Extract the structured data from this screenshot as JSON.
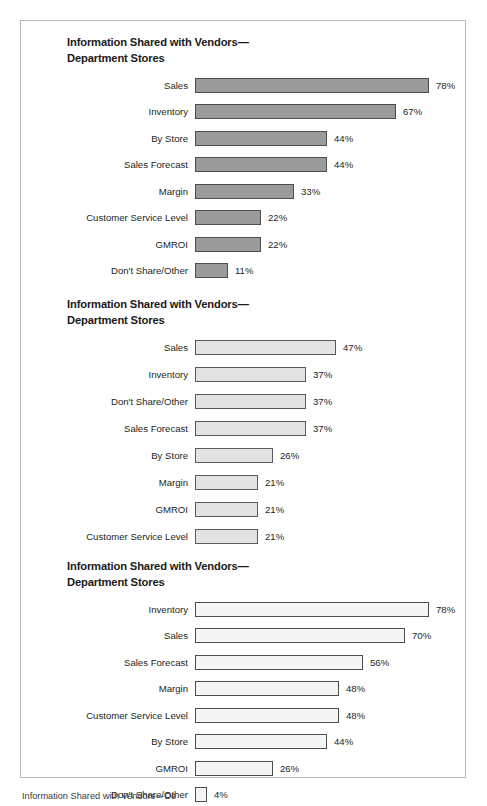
{
  "chart_data": [
    {
      "type": "bar",
      "orientation": "horizontal",
      "title": "Information Shared with Vendors—\nDepartment Stores",
      "title_line_1": "Information Shared with Vendors—",
      "title_line_2": "Department Stores",
      "xlabel": "",
      "ylabel": "",
      "xlim": [
        0,
        78
      ],
      "grid": false,
      "legend": "none",
      "value_suffix": "%",
      "categories": [
        "Sales",
        "Inventory",
        "By Store",
        "Sales Forecast",
        "Margin",
        "Customer Service Level",
        "GMROI",
        "Don't Share/Other"
      ],
      "values": [
        78,
        67,
        44,
        44,
        33,
        22,
        22,
        11
      ],
      "value_labels": [
        "78%",
        "67%",
        "44%",
        "44%",
        "33%",
        "22%",
        "22%",
        "11%"
      ],
      "bar_fill": "#9b9b9b",
      "bar_stroke": "#4d4d4d"
    },
    {
      "type": "bar",
      "orientation": "horizontal",
      "title": "Information Shared with Vendors—\nDepartment Stores",
      "title_line_1": "Information Shared with Vendors—",
      "title_line_2": "Department Stores",
      "xlabel": "",
      "ylabel": "",
      "xlim": [
        0,
        78
      ],
      "grid": false,
      "legend": "none",
      "value_suffix": "%",
      "categories": [
        "Sales",
        "Inventory",
        "Don't Share/Other",
        "Sales Forecast",
        "By Store",
        "Margin",
        "GMROI",
        "Customer Service Level"
      ],
      "values": [
        47,
        37,
        37,
        37,
        26,
        21,
        21,
        21
      ],
      "value_labels": [
        "47%",
        "37%",
        "37%",
        "37%",
        "26%",
        "21%",
        "21%",
        "21%"
      ],
      "bar_fill": "#e3e3e3",
      "bar_stroke": "#595959"
    },
    {
      "type": "bar",
      "orientation": "horizontal",
      "title": "Information Shared with Vendors—\nDepartment Stores",
      "title_line_1": "Information Shared with Vendors—",
      "title_line_2": "Department Stores",
      "xlabel": "",
      "ylabel": "",
      "xlim": [
        0,
        78
      ],
      "grid": false,
      "legend": "none",
      "value_suffix": "%",
      "categories": [
        "Inventory",
        "Sales",
        "Sales Forecast",
        "Margin",
        "Customer Service Level",
        "By Store",
        "GMROI",
        "Don't Share/Other"
      ],
      "values": [
        78,
        70,
        56,
        48,
        48,
        44,
        26,
        4
      ],
      "value_labels": [
        "78%",
        "70%",
        "56%",
        "48%",
        "48%",
        "44%",
        "26%",
        "4%"
      ],
      "bar_fill": "#f5f5f5",
      "bar_stroke": "#4d4d4d"
    }
  ],
  "caption": "Information Shared with Vendors—De",
  "scale": {
    "px_per_percent": 3.0,
    "max_value": 78
  }
}
